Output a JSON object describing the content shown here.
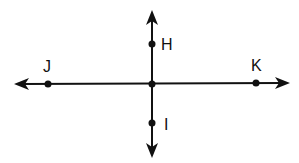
{
  "diagram": {
    "type": "intersecting-lines",
    "lines": [
      {
        "name": "line-JK",
        "orientation": "horizontal",
        "points": [
          "J",
          "K"
        ],
        "arrows": "both"
      },
      {
        "name": "line-HI",
        "orientation": "vertical",
        "points": [
          "H",
          "I"
        ],
        "arrows": "both"
      }
    ],
    "points": [
      {
        "id": "H",
        "label": "H"
      },
      {
        "id": "I",
        "label": "I"
      },
      {
        "id": "J",
        "label": "J"
      },
      {
        "id": "K",
        "label": "K"
      },
      {
        "id": "center",
        "label": ""
      }
    ],
    "colors": {
      "stroke": "#111111",
      "background": "#ffffff"
    }
  }
}
